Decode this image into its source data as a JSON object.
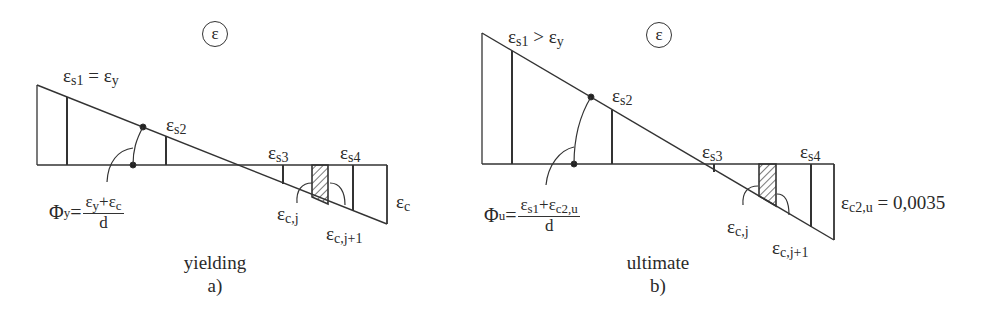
{
  "figure": {
    "symbol": "ε",
    "panel_a": {
      "caption": "yielding",
      "sublabel": "a)",
      "labels": {
        "es1": "ε",
        "es1_sub": "s1",
        "es1_rel": " = ε",
        "es1_rel_sub": "y",
        "es2": "ε",
        "es2_sub": "s2",
        "es3": "ε",
        "es3_sub": "s3",
        "es4": "ε",
        "es4_sub": "s4",
        "ec": "ε",
        "ec_sub": "c",
        "ecj": "ε",
        "ecj_sub": "c,j",
        "ecj1": "ε",
        "ecj1_sub": "c,j+1"
      },
      "formula": {
        "lhs": "Φ",
        "lhs_sub": "y",
        "eq": "=",
        "num_a": "ε",
        "num_a_sub": "y",
        "plus": "+ε",
        "num_b_sub": "c",
        "den": "d"
      }
    },
    "panel_b": {
      "caption": "ultimate",
      "sublabel": "b)",
      "labels": {
        "es1": "ε",
        "es1_sub": "s1",
        "es1_rel": " > ε",
        "es1_rel_sub": "y",
        "es2": "ε",
        "es2_sub": "s2",
        "es3": "ε",
        "es3_sub": "s3",
        "es4": "ε",
        "es4_sub": "s4",
        "ec": "ε",
        "ec_sub": "c2,u",
        "ec_val": " = 0,0035",
        "ecj": "ε",
        "ecj_sub": "c,j",
        "ecj1": "ε",
        "ecj1_sub": "c,j+1"
      },
      "formula": {
        "lhs": "Φ",
        "lhs_sub": "u",
        "eq": "=",
        "num_a": "ε",
        "num_a_sub": "s1",
        "plus": "+ε",
        "num_b_sub": "c2,u",
        "den": "d"
      }
    }
  }
}
